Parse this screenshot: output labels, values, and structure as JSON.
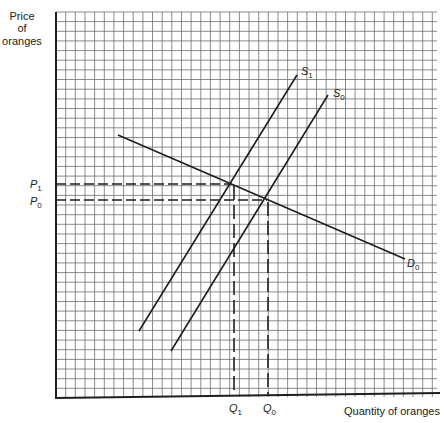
{
  "labels": {
    "y_axis": [
      "Price",
      "of",
      "oranges"
    ],
    "x_axis": "Quantity of oranges",
    "p1": {
      "base": "P",
      "sub": "1"
    },
    "p0": {
      "base": "P",
      "sub": "0"
    },
    "q1": {
      "base": "Q",
      "sub": "1"
    },
    "q0": {
      "base": "Q",
      "sub": "0"
    },
    "s1": {
      "base": "S",
      "sub": "1"
    },
    "s0": {
      "base": "S",
      "sub": "0"
    },
    "d0": {
      "base": "D",
      "sub": "0"
    }
  },
  "colors": {
    "grid": "#6f6f6f",
    "line": "#1e1e1e",
    "text": "#222222",
    "background": "#ffffff"
  },
  "chart_data": {
    "type": "line",
    "title": "",
    "xlabel": "Quantity of oranges",
    "ylabel": "Price of oranges",
    "grid": true,
    "note": "No numeric tick values are shown on the figure. Coordinates below are pixel positions in the 444x423 image and are approximate; the bottom-right axis corner is estimated. Gridline indices are relative (origin at bottom-left).",
    "grid_layout": {
      "left": 56,
      "right": 437,
      "top": 12,
      "bottom": 397,
      "spacing": 9.65
    },
    "series": [
      {
        "name": "S1",
        "kind": "supply",
        "points_px": [
          [
            139,
            331
          ],
          [
            297,
            75
          ]
        ]
      },
      {
        "name": "S0",
        "kind": "supply",
        "points_px": [
          [
            171,
            351
          ],
          [
            328,
            95
          ]
        ]
      },
      {
        "name": "D0",
        "kind": "demand",
        "points_px": [
          [
            118,
            135
          ],
          [
            405,
            259
          ]
        ]
      }
    ],
    "equilibria": [
      {
        "name": "E1",
        "curves": [
          "S1",
          "D0"
        ],
        "point_px": [
          232,
          184
        ],
        "price_label": "P1",
        "quantity_label": "Q1"
      },
      {
        "name": "E0",
        "curves": [
          "S0",
          "D0"
        ],
        "point_px": [
          267,
          200
        ],
        "price_label": "P0",
        "quantity_label": "Q0"
      }
    ],
    "reference_lines": [
      {
        "label": "P1",
        "type": "horizontal-dashed",
        "y_px": 184
      },
      {
        "label": "P0",
        "type": "horizontal-dashed",
        "y_px": 200
      },
      {
        "label": "Q1",
        "type": "vertical-dashed",
        "x_px": 234
      },
      {
        "label": "Q0",
        "type": "vertical-dashed",
        "x_px": 268
      }
    ],
    "relative_grid_values": {
      "P1": 22.1,
      "P0": 20.4,
      "Q1": 18.4,
      "Q0": 21.9
    }
  }
}
